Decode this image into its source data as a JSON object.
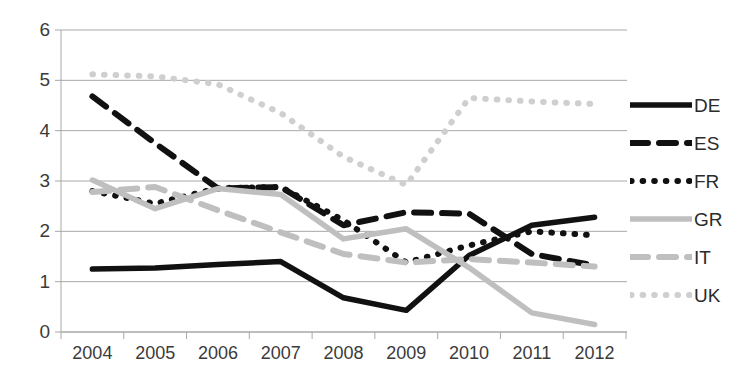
{
  "chart_data": {
    "type": "line",
    "title": "",
    "xlabel": "",
    "ylabel": "",
    "ylim": [
      0,
      6
    ],
    "yticks": [
      0,
      1,
      2,
      3,
      4,
      5,
      6
    ],
    "grid": true,
    "legend_position": "right",
    "categories": [
      "2004",
      "2005",
      "2006",
      "2007",
      "2008",
      "2009",
      "2010",
      "2011",
      "2012"
    ],
    "series": [
      {
        "name": "DE",
        "style": "solid",
        "color": "#111111",
        "values": [
          1.25,
          1.27,
          1.34,
          1.4,
          0.68,
          0.43,
          1.52,
          2.12,
          2.28
        ]
      },
      {
        "name": "ES",
        "style": "dashed",
        "color": "#111111",
        "values": [
          4.68,
          3.75,
          2.85,
          2.88,
          2.12,
          2.38,
          2.35,
          1.55,
          1.32
        ]
      },
      {
        "name": "FR",
        "style": "dotted",
        "color": "#111111",
        "values": [
          2.8,
          2.55,
          2.86,
          2.88,
          2.22,
          1.38,
          1.72,
          2.0,
          1.92
        ]
      },
      {
        "name": "GR",
        "style": "solid",
        "color": "#bfbfbf",
        "values": [
          3.02,
          2.45,
          2.85,
          2.73,
          1.85,
          2.05,
          1.28,
          0.38,
          0.15
        ]
      },
      {
        "name": "IT",
        "style": "dashed",
        "color": "#bfbfbf",
        "values": [
          2.78,
          2.88,
          2.42,
          1.98,
          1.55,
          1.38,
          1.45,
          1.38,
          1.3
        ]
      },
      {
        "name": "UK",
        "style": "dotted",
        "color": "#cfcfcf",
        "values": [
          5.12,
          5.08,
          4.92,
          4.35,
          3.48,
          2.92,
          4.65,
          4.58,
          4.53
        ]
      }
    ]
  },
  "axis": {
    "y_tick_labels": [
      "6",
      "5",
      "4",
      "3",
      "2",
      "1",
      "0"
    ],
    "x_tick_labels": [
      "2004",
      "2005",
      "2006",
      "2007",
      "2008",
      "2009",
      "2010",
      "2011",
      "2012"
    ]
  },
  "legend": {
    "items": [
      {
        "label": "DE",
        "key": "solid-black-line-key"
      },
      {
        "label": "ES",
        "key": "dashed-black-line-key"
      },
      {
        "label": "FR",
        "key": "dotted-black-line-key"
      },
      {
        "label": "GR",
        "key": "solid-gray-line-key"
      },
      {
        "label": "IT",
        "key": "dashed-gray-line-key"
      },
      {
        "label": "UK",
        "key": "dotted-gray-line-key"
      }
    ]
  },
  "colors": {
    "black_series": "#111111",
    "gray_series": "#bfbfbf",
    "light_gray_series": "#cfcfcf",
    "gridline": "#a8a8a8",
    "text": "#3b3b3b"
  }
}
